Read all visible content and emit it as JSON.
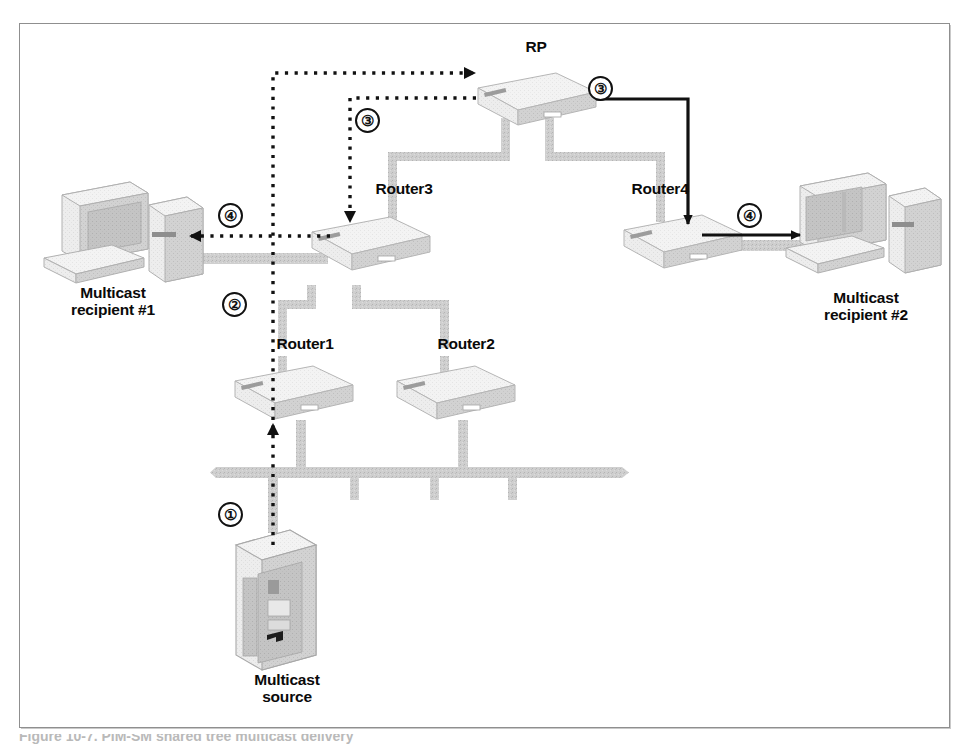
{
  "figure": {
    "type": "network-topology-diagram",
    "caption_partial": "Figure 10-7. PIM-SM shared tree multicast delivery"
  },
  "nodes": [
    {
      "id": "rp",
      "label": "RP",
      "kind": "router",
      "x": 536,
      "y": 50,
      "label_align": "center"
    },
    {
      "id": "router3",
      "label": "Router3",
      "kind": "router",
      "x": 404,
      "y": 190,
      "label_align": "center"
    },
    {
      "id": "router4",
      "label": "Router4",
      "kind": "router",
      "x": 660,
      "y": 190,
      "label_align": "center"
    },
    {
      "id": "router1",
      "label": "Router1",
      "kind": "router",
      "x": 305,
      "y": 344,
      "label_align": "center"
    },
    {
      "id": "router2",
      "label": "Router2",
      "kind": "router",
      "x": 466,
      "y": 344,
      "label_align": "center"
    },
    {
      "id": "recipient1",
      "label": "Multicast\nrecipient #1",
      "kind": "workstation",
      "x": 113,
      "y": 287,
      "label_align": "center"
    },
    {
      "id": "recipient2",
      "label": "Multicast\nrecipient #2",
      "kind": "workstation",
      "x": 866,
      "y": 292,
      "label_align": "center"
    },
    {
      "id": "source",
      "label": "Multicast\nsource",
      "kind": "server",
      "x": 287,
      "y": 674,
      "label_align": "center"
    }
  ],
  "steps": [
    {
      "number": "①",
      "id": "step-1",
      "x": 218,
      "y": 502,
      "style": "dotted",
      "description": "Source sends multicast to Router1"
    },
    {
      "number": "②",
      "id": "step-2",
      "x": 222,
      "y": 292,
      "style": "dotted",
      "description": "Router1 registers with RP"
    },
    {
      "number": "③",
      "id": "step-3-left",
      "x": 355,
      "y": 108,
      "style": "dotted",
      "description": "RP forwards down shared tree to Router3"
    },
    {
      "number": "③",
      "id": "step-3-right",
      "x": 588,
      "y": 76,
      "style": "solid",
      "description": "RP forwards down shared tree to Router4"
    },
    {
      "number": "④",
      "id": "step-4-left",
      "x": 218,
      "y": 203,
      "style": "dotted",
      "description": "Router3 delivers to recipient #1"
    },
    {
      "number": "④",
      "id": "step-4-right",
      "x": 737,
      "y": 203,
      "style": "solid",
      "description": "Router4 delivers to recipient #2"
    }
  ],
  "links": [
    {
      "from": "rp",
      "to": "router3",
      "kind": "cable"
    },
    {
      "from": "rp",
      "to": "router4",
      "kind": "cable"
    },
    {
      "from": "router3",
      "to": "router1",
      "kind": "cable"
    },
    {
      "from": "router3",
      "to": "router2",
      "kind": "cable"
    },
    {
      "from": "router3",
      "to": "recipient1",
      "kind": "cable"
    },
    {
      "from": "router4",
      "to": "recipient2",
      "kind": "cable"
    },
    {
      "from": "router1",
      "to": "ethernet-bus",
      "kind": "cable"
    },
    {
      "from": "router2",
      "to": "ethernet-bus",
      "kind": "cable"
    },
    {
      "from": "source",
      "to": "ethernet-bus",
      "kind": "cable"
    }
  ],
  "colors": {
    "cable": "#c9c9c9",
    "device_face": "#ededed",
    "device_top": "#f4f4f4",
    "device_side": "#cfcfcf",
    "outline": "#9a9a9a",
    "arrow": "#111111",
    "frame": "#8f8f8f",
    "text": "#0a0a0a",
    "background": "#ffffff"
  }
}
